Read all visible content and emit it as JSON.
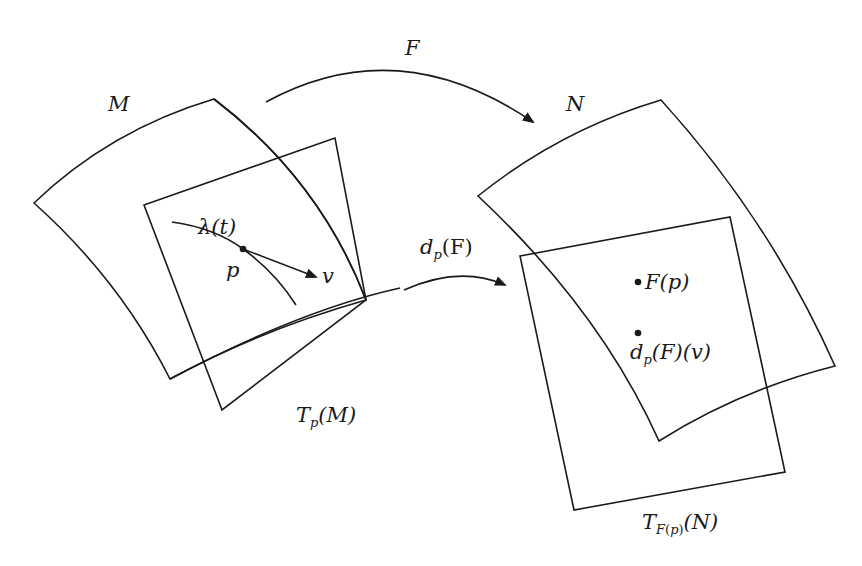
{
  "figure": {
    "type": "diagram",
    "stroke_color": "#1a1a1a",
    "background": "#ffffff"
  },
  "labels": {
    "manifold_m": "M",
    "manifold_n": "N",
    "map_f": "F",
    "curve": "λ(t)",
    "point_p": "p",
    "vector_v": "v",
    "differential_d": "d",
    "differential_sub": "p",
    "differential_arg": "(F)",
    "tangent_m_T": "T",
    "tangent_m_sub": "p",
    "tangent_m_arg": "(M)",
    "image_point": "F(p)",
    "image_vector_d": "d",
    "image_vector_sub": "p",
    "image_vector_arg": "(F)(v)",
    "tangent_n_T": "T",
    "tangent_n_sub_F": "F",
    "tangent_n_sub_paren_open": "(",
    "tangent_n_sub_p": "p",
    "tangent_n_sub_paren_close": ")",
    "tangent_n_arg": "(N)"
  },
  "elements": [
    {
      "id": "manifold-M",
      "shape": "curved-quadrilateral"
    },
    {
      "id": "tangent-plane-TpM",
      "shape": "quadrilateral"
    },
    {
      "id": "curve-lambda",
      "shape": "curve",
      "through": "p"
    },
    {
      "id": "tangent-vector-v",
      "shape": "arrow",
      "from": "p"
    },
    {
      "id": "map-arrow-F",
      "shape": "curved-arrow",
      "from": "M",
      "to": "N"
    },
    {
      "id": "map-arrow-dpF",
      "shape": "curved-arrow",
      "from": "TpM",
      "to": "TF(p)N"
    },
    {
      "id": "manifold-N",
      "shape": "curved-quadrilateral"
    },
    {
      "id": "tangent-plane-TFpN",
      "shape": "quadrilateral"
    },
    {
      "id": "point-Fp",
      "shape": "dot"
    },
    {
      "id": "point-dpFv",
      "shape": "dot"
    }
  ]
}
